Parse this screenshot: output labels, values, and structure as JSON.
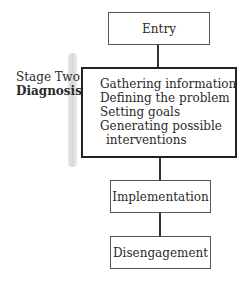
{
  "diagram": {
    "nodes": [
      {
        "id": "entry",
        "label": "Entry"
      },
      {
        "id": "diagnosis",
        "items": [
          "Gathering information",
          "Defining the problem",
          "Setting goals",
          "Generating possible",
          "interventions"
        ]
      },
      {
        "id": "implementation",
        "label": "Implementation"
      },
      {
        "id": "disengagement",
        "label": "Disengagement"
      }
    ],
    "stage_label": {
      "line1": "Stage Two:",
      "line2": "Diagnosis"
    },
    "edges": [
      [
        "entry",
        "diagnosis"
      ],
      [
        "diagnosis",
        "implementation"
      ],
      [
        "implementation",
        "disengagement"
      ]
    ]
  }
}
